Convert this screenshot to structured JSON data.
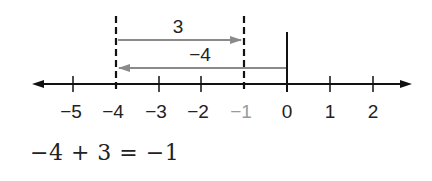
{
  "number_line": {
    "ticks": [
      {
        "value": -5,
        "label": "−5",
        "x": 73,
        "highlight": false
      },
      {
        "value": -4,
        "label": "−4",
        "x": 116,
        "highlight": false
      },
      {
        "value": -3,
        "label": "−3",
        "x": 159,
        "highlight": false
      },
      {
        "value": -2,
        "label": "−2",
        "x": 201,
        "highlight": false
      },
      {
        "value": -1,
        "label": "−1",
        "x": 244,
        "highlight": true
      },
      {
        "value": 0,
        "label": "0",
        "x": 287,
        "highlight": false
      },
      {
        "value": 1,
        "label": "1",
        "x": 330,
        "highlight": false
      },
      {
        "value": 2,
        "label": "2",
        "x": 373,
        "highlight": false
      }
    ],
    "arrows": [
      {
        "label": "3",
        "from": -4,
        "to": -1
      },
      {
        "label": "−4",
        "from": 0,
        "to": -4
      }
    ],
    "colors": {
      "axis": "#111111",
      "arrow": "#8a8a8a",
      "highlight_label": "#9a9a9a"
    }
  },
  "equation": "−4 + 3 = −1"
}
